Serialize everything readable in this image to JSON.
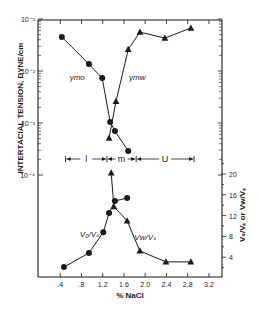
{
  "chart_data": {
    "type": "line",
    "title": "",
    "xlabel": "% NaCl",
    "xlim": [
      0,
      3.4
    ],
    "xticks": [
      0.4,
      0.8,
      1.2,
      1.6,
      2.0,
      2.4,
      2.8,
      3.2
    ],
    "xtick_labels": [
      ".4",
      ".8",
      "1.2",
      "1.6",
      "2.0",
      "2.4",
      "2.8",
      "3.2"
    ],
    "upper_panel": {
      "ylabel": "INTERTACIAL TENSION, DYNE/cm",
      "yscale": "log",
      "ylim": [
        0.0001,
        0.1
      ],
      "ytick_labels": [
        "10⁻¹",
        "10⁻²",
        "10⁻³",
        "10⁻⁴"
      ],
      "series": [
        {
          "name": "γmo",
          "marker": "circle",
          "x": [
            0.43,
            0.94,
            1.19,
            1.34,
            1.43,
            1.68
          ],
          "values": [
            0.045,
            0.0136,
            0.0073,
            0.00105,
            0.0007,
            0.00029
          ]
        },
        {
          "name": "γmw",
          "marker": "triangle",
          "x": [
            1.32,
            1.45,
            1.68,
            1.9,
            2.37,
            2.86
          ],
          "values": [
            0.00051,
            0.0026,
            0.026,
            0.056,
            0.043,
            0.067
          ]
        }
      ]
    },
    "regions": [
      {
        "label": "l",
        "from": 0.5,
        "to": 1.28
      },
      {
        "label": "m",
        "from": 1.28,
        "to": 1.83
      },
      {
        "label": "U",
        "from": 1.83,
        "to": 2.92
      }
    ],
    "lower_panel": {
      "ylabel": "V₀/Vₛ or Vw/Vₛ",
      "yaxis_side": "right",
      "ylim": [
        0,
        22
      ],
      "yticks": [
        4,
        8,
        12,
        16,
        20
      ],
      "series": [
        {
          "name": "V₀/Vₛ",
          "marker": "circle",
          "x": [
            0.47,
            0.94,
            1.21,
            1.32,
            1.43,
            1.66
          ],
          "values": [
            2.1,
            4.8,
            8.8,
            12.5,
            14.8,
            15.4
          ]
        },
        {
          "name": "Vw/Vₛ",
          "marker": "triangle",
          "x": [
            1.36,
            1.41,
            1.66,
            1.9,
            2.39,
            2.86
          ],
          "values": [
            20.2,
            13.7,
            11.0,
            5.2,
            3.1,
            3.1
          ]
        }
      ]
    },
    "annotations": [
      {
        "text": "γmo",
        "x": 0.72,
        "y_px": 80
      },
      {
        "text": "γmw",
        "x": 1.85,
        "y_px": 80
      },
      {
        "text": "V₀/Vₛ",
        "x": 0.95,
        "y_px": 237
      },
      {
        "text": "Vw/Vₛ",
        "x": 2.0,
        "y_px": 240
      }
    ]
  }
}
